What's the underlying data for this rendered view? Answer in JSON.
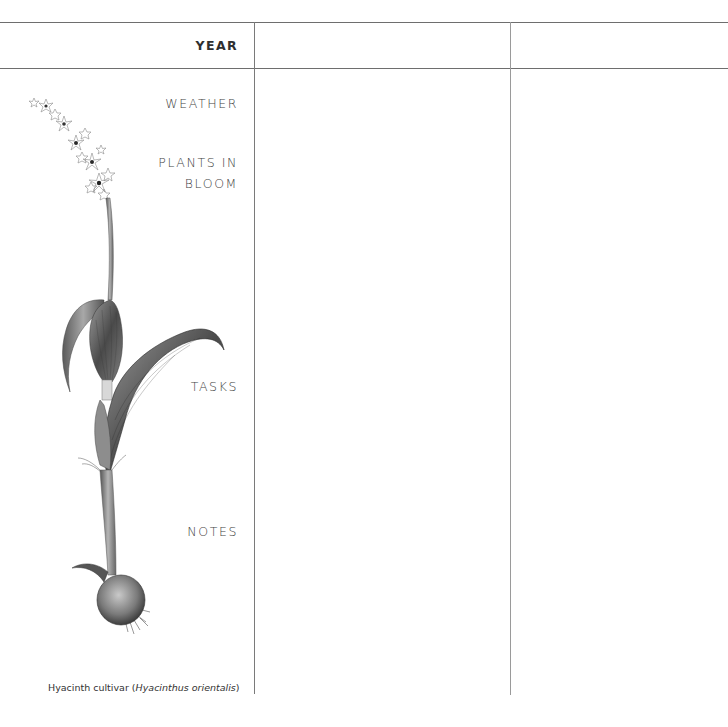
{
  "journal": {
    "header_label": "YEAR",
    "rows": [
      {
        "label_lines": [
          "WEATHER"
        ]
      },
      {
        "label_lines": [
          "PLANTS IN",
          "BLOOM"
        ]
      },
      {
        "label_lines": [
          "TASKS"
        ]
      },
      {
        "label_lines": [
          "NOTES"
        ]
      }
    ],
    "columns": [
      {
        "year_value": ""
      },
      {
        "year_value": ""
      }
    ]
  },
  "illustration": {
    "subject": "hyacinth-botanical-drawing",
    "caption_common": "Hyacinth cultivar (",
    "caption_latin": "Hyacinthus orientalis",
    "caption_close": ")"
  },
  "colors": {
    "rule": "#6e6e6e",
    "text": "#444444",
    "background": "#ffffff"
  }
}
